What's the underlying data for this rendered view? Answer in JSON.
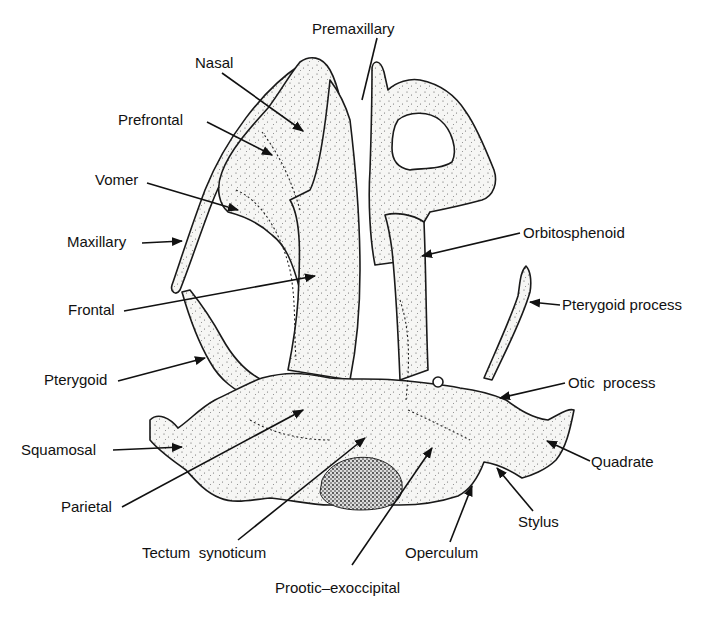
{
  "figure": {
    "colors": {
      "ink": "#111111",
      "bone_fill": "#f4f4f2",
      "background": "#ffffff"
    },
    "labels": [
      {
        "id": "premaxillary",
        "text": "Premaxillary"
      },
      {
        "id": "nasal",
        "text": "Nasal"
      },
      {
        "id": "prefrontal",
        "text": "Prefrontal"
      },
      {
        "id": "vomer",
        "text": "Vomer"
      },
      {
        "id": "maxillary",
        "text": "Maxillary"
      },
      {
        "id": "frontal",
        "text": "Frontal"
      },
      {
        "id": "pterygoid",
        "text": "Pterygoid"
      },
      {
        "id": "squamosal",
        "text": "Squamosal"
      },
      {
        "id": "parietal",
        "text": "Parietal"
      },
      {
        "id": "tectum-synoticum",
        "text": "Tectum  synoticum"
      },
      {
        "id": "prootic-exoccipital",
        "text": "Prootic–exoccipital"
      },
      {
        "id": "operculum",
        "text": "Operculum"
      },
      {
        "id": "stylus",
        "text": "Stylus"
      },
      {
        "id": "quadrate",
        "text": "Quadrate"
      },
      {
        "id": "otic-process",
        "text": "Otic  process"
      },
      {
        "id": "pterygoid-process",
        "text": "Pterygoid process"
      },
      {
        "id": "orbitosphenoid",
        "text": "Orbitosphenoid"
      }
    ]
  }
}
